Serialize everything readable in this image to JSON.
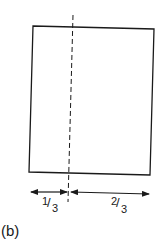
{
  "figure": {
    "caption": "(b)",
    "rectangle": {
      "corners": {
        "tl": [
          33,
          26
        ],
        "tr": [
          154,
          29
        ],
        "br": [
          150,
          175
        ],
        "bl": [
          29,
          172
        ]
      },
      "stroke": "#1a1a1a"
    },
    "dashed_line": {
      "top": [
        73,
        15
      ],
      "bottom": [
        68,
        202
      ]
    },
    "dimensions": [
      {
        "name": "left-part",
        "numerator": "1",
        "denominator": "3",
        "from_x": 30,
        "to_x": 68,
        "y": 192
      },
      {
        "name": "right-part",
        "numerator": "2",
        "denominator": "3",
        "from_x": 70,
        "to_x": 149,
        "y": 193
      }
    ]
  }
}
